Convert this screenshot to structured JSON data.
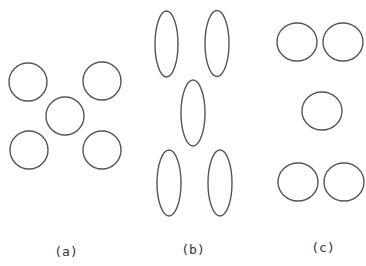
{
  "diagram": {
    "stroke_color": "#555555",
    "panels": [
      {
        "id": "a",
        "label": "(a)",
        "label_pos": [
          66,
          256
        ],
        "shape": "circle",
        "items": [
          {
            "cx": 28,
            "cy": 82,
            "rx": 19,
            "ry": 19
          },
          {
            "cx": 102,
            "cy": 81,
            "rx": 19,
            "ry": 19
          },
          {
            "cx": 65,
            "cy": 116,
            "rx": 19,
            "ry": 19
          },
          {
            "cx": 29,
            "cy": 150,
            "rx": 19,
            "ry": 19
          },
          {
            "cx": 102,
            "cy": 150,
            "rx": 19,
            "ry": 19
          }
        ]
      },
      {
        "id": "b",
        "label": "(b)",
        "label_pos": [
          193,
          254
        ],
        "shape": "ellipse",
        "items": [
          {
            "cx": 166.5,
            "cy": 44,
            "rx": 11.5,
            "ry": 33
          },
          {
            "cx": 217,
            "cy": 43.5,
            "rx": 12,
            "ry": 33
          },
          {
            "cx": 193,
            "cy": 113,
            "rx": 12,
            "ry": 33
          },
          {
            "cx": 169,
            "cy": 183,
            "rx": 12,
            "ry": 33
          },
          {
            "cx": 220,
            "cy": 183,
            "rx": 12,
            "ry": 33
          }
        ]
      },
      {
        "id": "c",
        "label": "(c)",
        "label_pos": [
          323,
          252
        ],
        "shape": "circle",
        "items": [
          {
            "cx": 297,
            "cy": 42,
            "rx": 20,
            "ry": 19
          },
          {
            "cx": 343,
            "cy": 42,
            "rx": 20,
            "ry": 19
          },
          {
            "cx": 322,
            "cy": 111,
            "rx": 20,
            "ry": 19
          },
          {
            "cx": 298,
            "cy": 182,
            "rx": 20,
            "ry": 19
          },
          {
            "cx": 344,
            "cy": 182,
            "rx": 20,
            "ry": 19
          }
        ]
      }
    ]
  }
}
